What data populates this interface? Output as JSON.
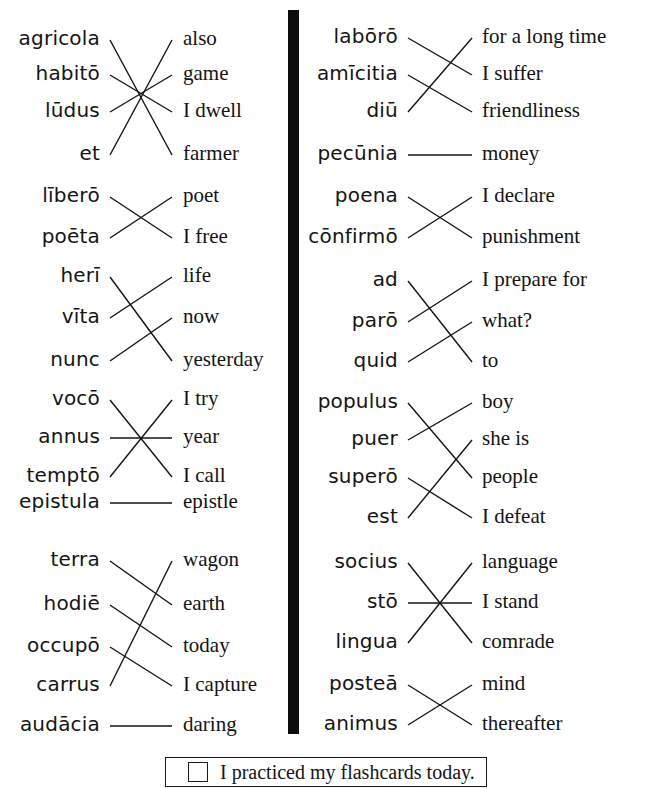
{
  "worksheet": {
    "title": "Latin Vocabulary Matching Worksheet",
    "footer": {
      "checkbox_label": "I practiced my flashcards today.",
      "checked": false
    },
    "colors": {
      "ink": "#141414",
      "divider": "#0d0d0d",
      "paper": "#ffffff"
    }
  },
  "columns": [
    {
      "id": "left",
      "groups": [
        {
          "id": "left-group-1",
          "latin": [
            "agricola",
            "habitō",
            "lūdus",
            "et"
          ],
          "english": [
            "also",
            "game",
            "I dwell",
            "farmer"
          ],
          "matches": [
            {
              "latin_index": 0,
              "english_index": 3
            },
            {
              "latin_index": 1,
              "english_index": 2
            },
            {
              "latin_index": 2,
              "english_index": 1
            },
            {
              "latin_index": 3,
              "english_index": 0
            }
          ]
        },
        {
          "id": "left-group-2",
          "latin": [
            "līberō",
            "poēta"
          ],
          "english": [
            "poet",
            "I free"
          ],
          "matches": [
            {
              "latin_index": 0,
              "english_index": 1
            },
            {
              "latin_index": 1,
              "english_index": 0
            }
          ]
        },
        {
          "id": "left-group-3",
          "latin": [
            "herī",
            "vīta",
            "nunc"
          ],
          "english": [
            "life",
            "now",
            "yesterday"
          ],
          "matches": [
            {
              "latin_index": 0,
              "english_index": 2
            },
            {
              "latin_index": 1,
              "english_index": 0
            },
            {
              "latin_index": 2,
              "english_index": 1
            }
          ]
        },
        {
          "id": "left-group-4",
          "latin": [
            "vocō",
            "annus",
            "temptō"
          ],
          "english": [
            "I try",
            "year",
            "I call"
          ],
          "matches": [
            {
              "latin_index": 0,
              "english_index": 2
            },
            {
              "latin_index": 1,
              "english_index": 1
            },
            {
              "latin_index": 2,
              "english_index": 0
            }
          ]
        },
        {
          "id": "left-group-5",
          "latin": [
            "epistula"
          ],
          "english": [
            "epistle"
          ],
          "matches": [
            {
              "latin_index": 0,
              "english_index": 0
            }
          ]
        },
        {
          "id": "left-group-6",
          "latin": [
            "terra",
            "hodiē",
            "occupō",
            "carrus"
          ],
          "english": [
            "wagon",
            "earth",
            "today",
            "I capture"
          ],
          "matches": [
            {
              "latin_index": 0,
              "english_index": 1
            },
            {
              "latin_index": 1,
              "english_index": 2
            },
            {
              "latin_index": 2,
              "english_index": 3
            },
            {
              "latin_index": 3,
              "english_index": 0
            }
          ]
        },
        {
          "id": "left-group-7",
          "latin": [
            "audācia"
          ],
          "english": [
            "daring"
          ],
          "matches": [
            {
              "latin_index": 0,
              "english_index": 0
            }
          ]
        }
      ]
    },
    {
      "id": "right",
      "groups": [
        {
          "id": "right-group-1",
          "latin": [
            "labōrō",
            "amīcitia",
            "diū"
          ],
          "english": [
            "for a long time",
            "I suffer",
            "friendliness"
          ],
          "matches": [
            {
              "latin_index": 0,
              "english_index": 1
            },
            {
              "latin_index": 1,
              "english_index": 2
            },
            {
              "latin_index": 2,
              "english_index": 0
            }
          ]
        },
        {
          "id": "right-group-2",
          "latin": [
            "pecūnia"
          ],
          "english": [
            "money"
          ],
          "matches": [
            {
              "latin_index": 0,
              "english_index": 0
            }
          ]
        },
        {
          "id": "right-group-3",
          "latin": [
            "poena",
            "cōnfirmō"
          ],
          "english": [
            "I declare",
            "punishment"
          ],
          "matches": [
            {
              "latin_index": 0,
              "english_index": 1
            },
            {
              "latin_index": 1,
              "english_index": 0
            }
          ]
        },
        {
          "id": "right-group-4",
          "latin": [
            "ad",
            "parō",
            "quid"
          ],
          "english": [
            "I prepare for",
            "what?",
            "to"
          ],
          "matches": [
            {
              "latin_index": 0,
              "english_index": 2
            },
            {
              "latin_index": 1,
              "english_index": 0
            },
            {
              "latin_index": 2,
              "english_index": 1
            }
          ]
        },
        {
          "id": "right-group-5",
          "latin": [
            "populus",
            "puer",
            "superō",
            "est"
          ],
          "english": [
            "boy",
            "she is",
            "people",
            "I defeat"
          ],
          "matches": [
            {
              "latin_index": 0,
              "english_index": 2
            },
            {
              "latin_index": 1,
              "english_index": 0
            },
            {
              "latin_index": 2,
              "english_index": 3
            },
            {
              "latin_index": 3,
              "english_index": 1
            }
          ]
        },
        {
          "id": "right-group-6",
          "latin": [
            "socius",
            "stō",
            "lingua"
          ],
          "english": [
            "language",
            "I stand",
            "comrade"
          ],
          "matches": [
            {
              "latin_index": 0,
              "english_index": 2
            },
            {
              "latin_index": 1,
              "english_index": 1
            },
            {
              "latin_index": 2,
              "english_index": 0
            }
          ]
        },
        {
          "id": "right-group-7",
          "latin": [
            "posteā",
            "animus"
          ],
          "english": [
            "mind",
            "thereafter"
          ],
          "matches": [
            {
              "latin_index": 0,
              "english_index": 1
            },
            {
              "latin_index": 1,
              "english_index": 0
            }
          ]
        }
      ]
    }
  ],
  "layout": {
    "rows": {
      "left": [
        40,
        75,
        112,
        155,
        197,
        238,
        277,
        318,
        361,
        400,
        438,
        477,
        503,
        561,
        605,
        647,
        686,
        726
      ],
      "right": [
        38,
        75,
        112,
        155,
        197,
        238,
        281,
        322,
        362,
        403,
        440,
        478,
        518,
        563,
        603,
        643,
        685,
        725
      ]
    },
    "left_column": {
      "latin_right_edge": 100,
      "line_start_x": 110,
      "line_end_x": 172,
      "english_left_edge": 183
    },
    "right_column": {
      "latin_right_edge": 398,
      "line_start_x": 408,
      "line_end_x": 472,
      "english_left_edge": 482
    },
    "divider": {
      "x": 288,
      "y": 10,
      "width": 11,
      "height": 724
    },
    "footer_box": {
      "x": 165,
      "y": 757,
      "width": 322,
      "height": 30
    }
  }
}
